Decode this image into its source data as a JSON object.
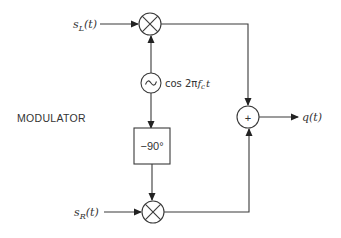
{
  "diagram": {
    "title_label": "MODULATOR",
    "inputs": {
      "left": {
        "symbol": "s",
        "subscript": "L",
        "arg": "(t)"
      },
      "right": {
        "symbol": "s",
        "subscript": "R",
        "arg": "(t)"
      }
    },
    "oscillator": {
      "glyph": "~",
      "label_prefix": "cos 2π",
      "label_f": "f",
      "label_sub": "c",
      "label_t": "t"
    },
    "phase_shifter": {
      "label": "−90°"
    },
    "adder": {
      "glyph": "+"
    },
    "output": {
      "label": "q(t)"
    },
    "colors": {
      "line": "#3a3a3a",
      "background": "#ffffff"
    }
  }
}
